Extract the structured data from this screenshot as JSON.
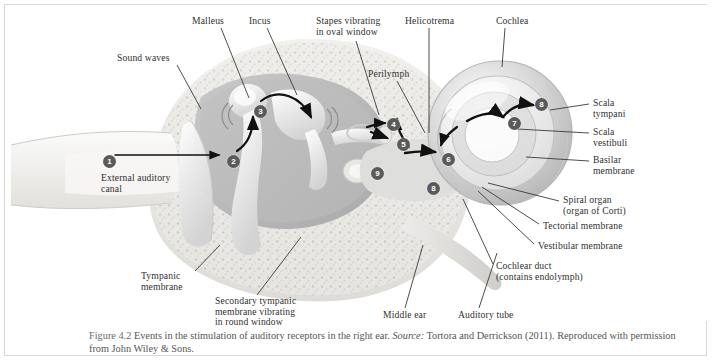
{
  "figure": {
    "caption_label": "Figure 4.2",
    "caption_text": "Events in the stimulation of auditory receptors in the right ear.",
    "source_label": "Source:",
    "source_text": "Tortora and Derrickson (2011). Reproduced with permission from John Wiley & Sons.",
    "colors": {
      "marker_fill": "#5a5a5a",
      "marker_text": "#ffffff",
      "label_text": "#2f2f2f",
      "caption_text": "#555555",
      "frame_border": "#d8d8d8",
      "leader_line": "#3a3a3a",
      "background": "#ffffff"
    }
  },
  "labels": [
    {
      "id": "sound-waves",
      "text": "Sound waves",
      "x": 112,
      "y": 48,
      "leader": [
        [
          172,
          60
        ],
        [
          196,
          104
        ]
      ]
    },
    {
      "id": "malleus",
      "text": "Malleus",
      "x": 187,
      "y": 11,
      "leader": [
        [
          216,
          23
        ],
        [
          244,
          93
        ]
      ]
    },
    {
      "id": "incus",
      "text": "Incus",
      "x": 244,
      "y": 11,
      "leader": [
        [
          262,
          23
        ],
        [
          292,
          90
        ]
      ]
    },
    {
      "id": "stapes-oval-window",
      "text": "Stapes vibrating\nin oval window",
      "x": 311,
      "y": 11,
      "leader": [
        [
          351,
          36
        ],
        [
          374,
          110
        ]
      ]
    },
    {
      "id": "helicotrema",
      "text": "Helicotrema",
      "x": 400,
      "y": 11,
      "leader": [
        [
          424,
          23
        ],
        [
          424,
          128
        ]
      ]
    },
    {
      "id": "cochlea",
      "text": "Cochlea",
      "x": 491,
      "y": 11,
      "leader": [
        [
          500,
          23
        ],
        [
          497,
          62
        ]
      ]
    },
    {
      "id": "perilymph",
      "text": "Perilymph",
      "x": 363,
      "y": 64,
      "leader": [
        [
          392,
          76
        ],
        [
          420,
          128
        ]
      ]
    },
    {
      "id": "external-auditory-canal",
      "text": "External auditory\ncanal",
      "x": 96,
      "y": 168,
      "leader": null
    },
    {
      "id": "scala-tympani",
      "text": "Scala\ntympani",
      "x": 588,
      "y": 93,
      "leader": [
        [
          584,
          99
        ],
        [
          545,
          105
        ]
      ]
    },
    {
      "id": "scala-vestibuli",
      "text": "Scala\nvestibuli",
      "x": 588,
      "y": 122,
      "leader": [
        [
          584,
          128
        ],
        [
          512,
          124
        ]
      ]
    },
    {
      "id": "basilar-membrane",
      "text": "Basilar\nmembrane",
      "x": 588,
      "y": 150,
      "leader": [
        [
          584,
          156
        ],
        [
          521,
          152
        ]
      ]
    },
    {
      "id": "spiral-organ",
      "text": "Spiral organ\n(organ of Corti)",
      "x": 558,
      "y": 190,
      "leader": [
        [
          554,
          196
        ],
        [
          483,
          178
        ]
      ]
    },
    {
      "id": "tectorial-membrane",
      "text": "Tectorial membrane",
      "x": 538,
      "y": 216,
      "leader": [
        [
          534,
          219
        ],
        [
          477,
          182
        ]
      ]
    },
    {
      "id": "vestibular-membrane",
      "text": "Vestibular membrane",
      "x": 533,
      "y": 236,
      "leader": [
        [
          529,
          239
        ],
        [
          473,
          186
        ]
      ]
    },
    {
      "id": "cochlear-duct",
      "text": "Cochlear duct\n(contains endolymph)",
      "x": 491,
      "y": 256,
      "leader": [
        [
          488,
          259
        ],
        [
          458,
          194
        ]
      ]
    },
    {
      "id": "tympanic-membrane",
      "text": "Tympanic\nmembrane",
      "x": 136,
      "y": 266,
      "leader": [
        [
          190,
          266
        ],
        [
          215,
          240
        ]
      ]
    },
    {
      "id": "secondary-tympanic-membrane",
      "text": "Secondary tympanic\nmembrane vibrating\nin round window",
      "x": 210,
      "y": 291,
      "leader": [
        [
          252,
          290
        ],
        [
          296,
          232
        ]
      ]
    },
    {
      "id": "middle-ear",
      "text": "Middle ear",
      "x": 378,
      "y": 305,
      "leader": [
        [
          400,
          303
        ],
        [
          418,
          240
        ]
      ]
    },
    {
      "id": "auditory-tube",
      "text": "Auditory tube",
      "x": 453,
      "y": 305,
      "leader": [
        [
          474,
          303
        ],
        [
          492,
          248
        ]
      ]
    }
  ],
  "markers": [
    {
      "n": "1",
      "x": 98,
      "y": 150
    },
    {
      "n": "2",
      "x": 222,
      "y": 150
    },
    {
      "n": "3",
      "x": 249,
      "y": 100
    },
    {
      "n": "4",
      "x": 382,
      "y": 113
    },
    {
      "n": "5",
      "x": 392,
      "y": 133
    },
    {
      "n": "6",
      "x": 437,
      "y": 148
    },
    {
      "n": "7",
      "x": 503,
      "y": 112
    },
    {
      "n": "8",
      "x": 530,
      "y": 93
    },
    {
      "n": "8b",
      "x": 422,
      "y": 177
    },
    {
      "n": "9",
      "x": 366,
      "y": 162
    }
  ]
}
